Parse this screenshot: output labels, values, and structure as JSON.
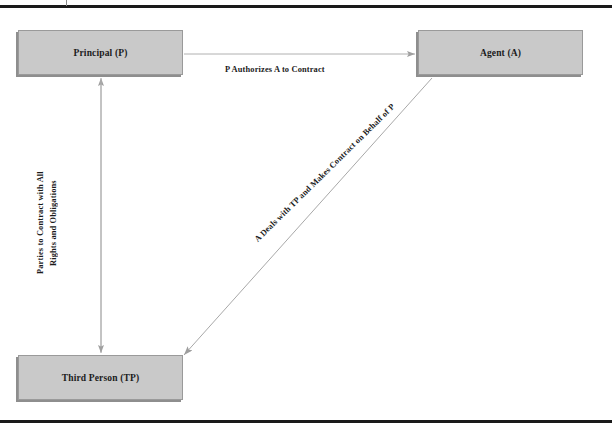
{
  "page": {
    "running_head": "",
    "background_color": "#ffffff",
    "rule_color": "#1a1a1a"
  },
  "diagram": {
    "type": "agency-relationship-flow",
    "node_fill_color": "#c9c9c9",
    "node_border_color": "#9a9a9a",
    "connector_color": "#a6a6a6",
    "nodes": [
      {
        "id": "principal",
        "label": "Principal (P)"
      },
      {
        "id": "agent",
        "label": "Agent (A)"
      },
      {
        "id": "third_person",
        "label": "Third Person (TP)"
      }
    ],
    "edges": [
      {
        "id": "p-to-a",
        "from": "principal",
        "to": "agent",
        "label": "P Authorizes A to Contract",
        "arrow": "single",
        "orientation": "horizontal"
      },
      {
        "id": "a-to-tp",
        "from": "agent",
        "to": "third_person",
        "label": "A Deals with TP and Makes Contract on Behalf of P",
        "arrow": "single",
        "orientation": "diagonal"
      },
      {
        "id": "tp-to-p",
        "from": "third_person",
        "to": "principal",
        "label_line1": "Parties to Contract with All",
        "label_line2": "Rights and Obligations",
        "arrow": "double",
        "orientation": "vertical"
      }
    ]
  }
}
